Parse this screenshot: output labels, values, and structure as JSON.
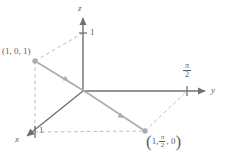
{
  "figure": {
    "background": "#ffffff",
    "width": 225,
    "height": 160,
    "colors": {
      "axis": "#6e7073",
      "curve": "#a9adb1",
      "dashed": "#b9bcc0",
      "text": "#5f6063",
      "point": "#a9adb1"
    }
  },
  "axes": [
    {
      "name": "x",
      "label": "x",
      "arrow": true
    },
    {
      "name": "y",
      "label": "y",
      "arrow": true
    },
    {
      "name": "z",
      "label": "z",
      "arrow": true
    }
  ],
  "ticks": {
    "z_one": "1",
    "x_one": "1",
    "y_pi_over_2": {
      "numerator": "π",
      "denominator": "2"
    }
  },
  "points": [
    {
      "name": "point-1-0-1",
      "label": "(1, 0, 1)",
      "coords": [
        1,
        0,
        1
      ]
    },
    {
      "name": "point-1-pi2-0",
      "label_open": "(",
      "label_first": "1,",
      "label_frac_num": "π",
      "label_frac_den": "2",
      "label_last": ", 0",
      "label_close": ")",
      "coords": [
        "1",
        "π/2",
        "0"
      ]
    }
  ],
  "curve": {
    "name": "helix-segment",
    "direction_arrows": 2,
    "from": "(1, 0, 1)",
    "to": "(1, π/2, 0)"
  }
}
